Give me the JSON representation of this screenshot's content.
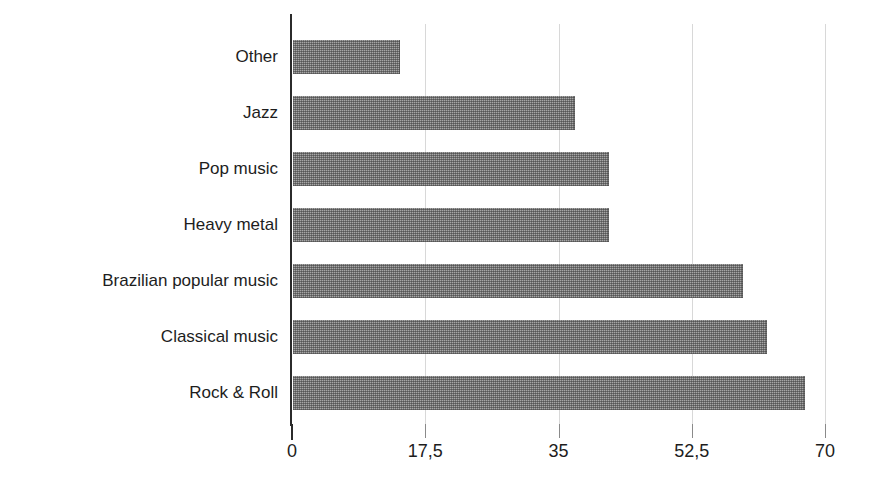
{
  "chart_data": {
    "type": "bar",
    "orientation": "horizontal",
    "title": "",
    "subtitle": "",
    "xlabel": "",
    "ylabel": "",
    "categories": [
      "Other",
      "Jazz",
      "Pop music",
      "Heavy metal",
      "Brazilian popular music",
      "Classical music",
      "Rock & Roll"
    ],
    "values": [
      14.1,
      37.0,
      41.5,
      41.5,
      59.1,
      62.2,
      67.2
    ],
    "xlim": [
      0,
      70
    ],
    "xticks": [
      0,
      17.5,
      35,
      52.5,
      70
    ],
    "xtick_labels": [
      "0",
      "17,5",
      "35",
      "52,5",
      "70"
    ],
    "grid": "vertical-only",
    "legend": "none",
    "bar_color": "#a6a6a6",
    "bar_fill": "dithered-gray-halftone",
    "axis_color": "#2b2b2b",
    "gridline_color": "#d8d8d8",
    "background_color": "#ffffff",
    "decimal_separator": ","
  },
  "axis": {
    "tick_labels": [
      "0",
      "17,5",
      "35",
      "52,5",
      "70"
    ],
    "category_labels": [
      "Other",
      "Jazz",
      "Pop music",
      "Heavy metal",
      "Brazilian popular music",
      "Classical music",
      "Rock & Roll"
    ]
  }
}
